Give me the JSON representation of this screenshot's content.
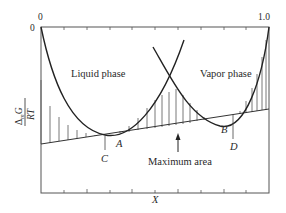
{
  "figure": {
    "type": "gibbs_free_energy_of_mixing_diagram",
    "axis_labels": {
      "x": "X",
      "y_numerator": "ΔmG",
      "y_numerator_symbol": "Δ",
      "y_numerator_sub": "m",
      "y_numerator_var": "G",
      "y_denominator": "RT"
    },
    "tick_labels": {
      "top_left": "0",
      "left_top": "0",
      "top_right": "1.0"
    },
    "phase_labels": {
      "liquid": "Liquid phase",
      "vapor": "Vapor phase"
    },
    "points": {
      "A": "A",
      "B": "B",
      "C": "C",
      "D": "D"
    },
    "annotation": {
      "max_area": "Maximum area"
    },
    "colors": {
      "line": "#2a2a2a",
      "frame": "#555555",
      "hatch": "#555555",
      "background": "#ffffff"
    }
  }
}
